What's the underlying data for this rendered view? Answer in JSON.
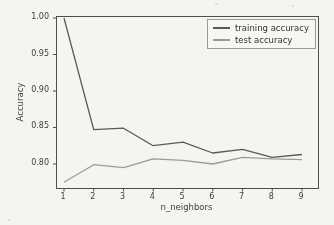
{
  "chart_data": {
    "type": "line",
    "title": "",
    "xlabel": "n_neighbors",
    "ylabel": "Accuracy",
    "x": [
      1,
      2,
      3,
      4,
      5,
      6,
      7,
      8,
      9
    ],
    "xtick_labels": [
      "1",
      "2",
      "3",
      "4",
      "5",
      "6",
      "7",
      "8",
      "9"
    ],
    "yticks": [
      0.8,
      0.85,
      0.9,
      0.95,
      1.0
    ],
    "ytick_labels": [
      "0.80",
      "0.85",
      "0.90",
      "0.95",
      "1.00"
    ],
    "xlim": [
      0.765,
      9.538
    ],
    "ylim": [
      0.7671,
      1.0014
    ],
    "grid": false,
    "legend_position": "upper right",
    "series": [
      {
        "name": "training accuracy",
        "color": "#59595b",
        "values": [
          1.0,
          0.847,
          0.849,
          0.825,
          0.83,
          0.815,
          0.82,
          0.809,
          0.813
        ]
      },
      {
        "name": "test accuracy",
        "color": "#9b9a97",
        "values": [
          0.775,
          0.799,
          0.795,
          0.807,
          0.805,
          0.8,
          0.809,
          0.807,
          0.806
        ]
      }
    ]
  },
  "colors": {
    "background": "#f5f4f1",
    "axis": "#4e4e4e",
    "text": "#3d3d3d",
    "legend_border": "#9a9a98",
    "legend_background": "#f7f6f3"
  }
}
